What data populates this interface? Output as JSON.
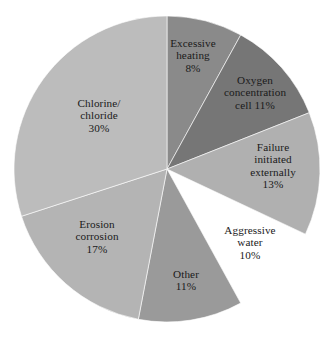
{
  "chart_data": {
    "type": "pie",
    "title": "",
    "subtitle": "",
    "xlabel": "",
    "ylabel": "",
    "grid": false,
    "legend": "none",
    "units": "percent",
    "start_angle_deg": 0,
    "direction": "clockwise",
    "total": 100,
    "categories": [
      "Excessive heating",
      "Oxygen concentration cell",
      "Failure initiated externally",
      "Aggressive water",
      "Other",
      "Erosion corrosion",
      "Chlorine/chloride"
    ],
    "values": [
      8,
      11,
      13,
      10,
      11,
      17,
      30
    ],
    "colors": [
      "#8a8a8a",
      "#767676",
      "#b0b0b0",
      "#ffffff",
      "#9a9a9a",
      "#b4b4b4",
      "#bcbcbc"
    ],
    "exploded": [
      false,
      false,
      false,
      true,
      false,
      false,
      false
    ],
    "slices": [
      {
        "name": "Excessive heating",
        "label": "Excessive\nheating\n8%",
        "value": 8,
        "percent": "8%",
        "color": "#8a8a8a",
        "exploded": false,
        "label_x": 193,
        "label_y": 56
      },
      {
        "name": "Oxygen concentration cell",
        "label": "Oxygen\nconcentration\ncell 11%",
        "value": 11,
        "percent": "11%",
        "color": "#767676",
        "exploded": false,
        "label_x": 255,
        "label_y": 93
      },
      {
        "name": "Failure initiated externally",
        "label": "Failure\ninitiated\nexternally\n13%",
        "value": 13,
        "percent": "13%",
        "color": "#b0b0b0",
        "exploded": false,
        "label_x": 273,
        "label_y": 166
      },
      {
        "name": "Aggressive water",
        "label": "Aggressive\nwater\n10%",
        "value": 10,
        "percent": "10%",
        "color": "#ffffff",
        "exploded": true,
        "label_x": 250,
        "label_y": 243
      },
      {
        "name": "Other",
        "label": "Other\n11%",
        "value": 11,
        "percent": "11%",
        "color": "#9a9a9a",
        "exploded": false,
        "label_x": 186,
        "label_y": 280
      },
      {
        "name": "Erosion corrosion",
        "label": "Erosion\ncorrosion\n17%",
        "value": 17,
        "percent": "17%",
        "color": "#b4b4b4",
        "exploded": false,
        "label_x": 97,
        "label_y": 237
      },
      {
        "name": "Chlorine/chloride",
        "label": "Chlorine/\nchloride\n30%",
        "value": 30,
        "percent": "30%",
        "color": "#bcbcbc",
        "exploded": false,
        "label_x": 99,
        "label_y": 116
      }
    ],
    "geometry": {
      "center_x": 167,
      "center_y": 169,
      "radius": 153,
      "explode_offset": 10
    }
  }
}
